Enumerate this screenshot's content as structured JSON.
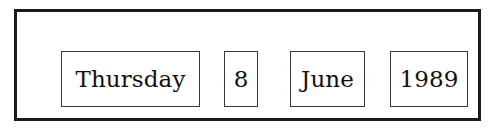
{
  "widget": {
    "name": "date-display",
    "frame_color": "#1b1b1b",
    "field_border_color": "#3a3a3a",
    "background_color": "#ffffff",
    "text_color": "#111111"
  },
  "date": {
    "weekday": "Thursday",
    "day": "8",
    "month": "June",
    "year": "1989"
  }
}
